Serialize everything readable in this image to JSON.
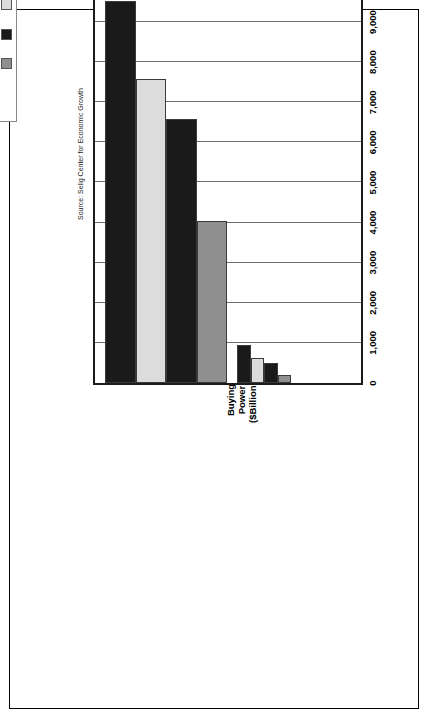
{
  "chart_data": {
    "type": "bar",
    "orientation": "horizontal",
    "title": "",
    "xlabel": "",
    "ylabel": "Buying Power ($Billions)",
    "ylabel_lines": [
      "Buying",
      "Power",
      "($Billions)"
    ],
    "categories": [
      "Hispanic",
      "Non-Hispanic"
    ],
    "tick_labels": [
      "0",
      "1,000",
      "2,000",
      "3,000",
      "4,000",
      "5,000",
      "6,000",
      "7,000",
      "8,000",
      "9,000",
      "10,000"
    ],
    "tick_values": [
      0,
      1000,
      2000,
      3000,
      4000,
      5000,
      6000,
      7000,
      8000,
      9000,
      10000
    ],
    "ylim": [
      0,
      10000
    ],
    "grid": true,
    "legend_position": "top-right",
    "series": [
      {
        "name": "1990",
        "color": "#8f8f8f",
        "values": [
          210,
          4050
        ]
      },
      {
        "name": "2000",
        "color": "#1a1a1a",
        "values": [
          490,
          6580
        ]
      },
      {
        "name": "2003",
        "color": "#dcdcdc",
        "values": [
          630,
          7570
        ]
      },
      {
        "name": "2008",
        "color": "#1a1a1a",
        "values": [
          960,
          9530
        ]
      }
    ],
    "source": "Source: Selig Center for Economic Growth"
  },
  "legend": {
    "title": "Legend",
    "items": [
      {
        "label": "1990",
        "color": "#8f8f8f"
      },
      {
        "label": "2000",
        "color": "#1a1a1a"
      },
      {
        "label": "2003",
        "color": "#dcdcdc"
      },
      {
        "label": "2008",
        "color": "#1a1a1a"
      }
    ]
  },
  "colors": {
    "axis": "#1b1b1b",
    "grid": "#6e6e6e",
    "background": "#ffffff",
    "text": "#000000"
  }
}
